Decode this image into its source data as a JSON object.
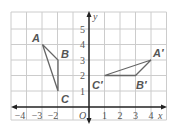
{
  "colors": {
    "grid": "#cccccc",
    "axis": "#222222",
    "triangle": "#666666",
    "label": "#555555",
    "background": "#ffffff"
  },
  "axes": {
    "x_label": "x",
    "y_label": "y",
    "origin_label": "O",
    "x_ticks": [
      "−4",
      "−3",
      "−2",
      "1",
      "2",
      "3",
      "4"
    ],
    "y_ticks": [
      "1",
      "2",
      "3",
      "4",
      "5"
    ]
  },
  "triangles": [
    {
      "name": "ABC",
      "vertices": [
        {
          "label": "A",
          "x": -3,
          "y": 4
        },
        {
          "label": "B",
          "x": -2,
          "y": 3
        },
        {
          "label": "C",
          "x": -2,
          "y": 1
        }
      ]
    },
    {
      "name": "A'B'C'",
      "vertices": [
        {
          "label": "A′",
          "x": 4,
          "y": 3
        },
        {
          "label": "B′",
          "x": 3,
          "y": 2
        },
        {
          "label": "C′",
          "x": 1,
          "y": 2
        }
      ]
    }
  ]
}
